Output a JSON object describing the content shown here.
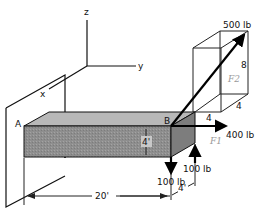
{
  "diagram": {
    "type": "3D statics free-body diagram",
    "axes": {
      "x_label": "x",
      "y_label": "y",
      "z_label": "z"
    },
    "points": {
      "a_label": "A",
      "b_label": "B"
    },
    "dimensions": {
      "beam_length": "20'",
      "beam_height": "4'",
      "end_offset": "4'",
      "box_height": "8",
      "box_width": "4",
      "box_depth": "4"
    },
    "forces": {
      "f1_label": "F1",
      "f2_label": "F2",
      "force_500": "500 lb",
      "force_400": "400 lb",
      "force_100_down": "100 lb",
      "force_100_up": "100 lb"
    },
    "colors": {
      "beam_front": "#8e8e8e",
      "beam_top": "#b4b4b4",
      "beam_side": "#7a7a7a",
      "line": "#111111",
      "f_label": "#9a9a9a"
    }
  }
}
